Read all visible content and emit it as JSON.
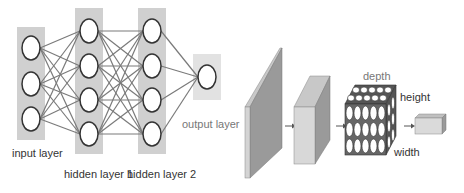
{
  "diagram": {
    "left_panel": {
      "title": "Fully connected neural network",
      "layers": [
        {
          "label": "input layer",
          "neurons": 3
        },
        {
          "label": "hidden layer 1",
          "neurons": 4
        },
        {
          "label": "hidden layer 2",
          "neurons": 4
        },
        {
          "label": "output layer",
          "neurons": 1
        }
      ]
    },
    "right_panel": {
      "title": "Convolutional network volumes",
      "labels": {
        "depth": "depth",
        "height": "height",
        "width": "width"
      },
      "stages": [
        "input slab",
        "conv volume",
        "neuron volume",
        "output block"
      ]
    },
    "colors": {
      "layer_bg": "#d0d0d0",
      "output_bg": "#e2e2e2",
      "edge": "#7a7a7a",
      "neuron_stroke": "#333333",
      "slab_face": "#9a9a9a",
      "box_front": "#d8d8d8",
      "box_side": "#9a9a9a"
    }
  }
}
